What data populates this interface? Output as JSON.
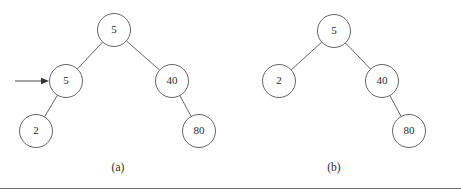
{
  "figure": {
    "background_color": "#ffffff",
    "stroke_color": "#555555",
    "text_color": "#2b2b2b",
    "rule_color": "#6d6d6d",
    "panels": [
      {
        "caption": "(a)",
        "caption_x": 118,
        "caption_y": 168,
        "pointer": {
          "label": "insertion-pointer",
          "x1": 15,
          "y1": 81,
          "x2": 49,
          "y2": 81,
          "target_node": "5-left"
        },
        "nodes": [
          {
            "id": "root",
            "value": "5",
            "cx": 114,
            "cy": 30,
            "r": 16.5
          },
          {
            "id": "5-left",
            "value": "5",
            "cx": 66,
            "cy": 81,
            "r": 16.5
          },
          {
            "id": "40",
            "value": "40",
            "cx": 172,
            "cy": 81,
            "r": 16.5
          },
          {
            "id": "2",
            "value": "2",
            "cx": 36,
            "cy": 131,
            "r": 16.5
          },
          {
            "id": "80",
            "value": "80",
            "cx": 199,
            "cy": 131,
            "r": 16.5
          }
        ],
        "edges": [
          {
            "from": "root",
            "to": "5-left"
          },
          {
            "from": "root",
            "to": "40"
          },
          {
            "from": "5-left",
            "to": "2"
          },
          {
            "from": "40",
            "to": "80"
          }
        ]
      },
      {
        "caption": "(b)",
        "caption_x": 334,
        "caption_y": 168,
        "pointer": null,
        "nodes": [
          {
            "id": "root",
            "value": "5",
            "cx": 334,
            "cy": 31,
            "r": 16.5
          },
          {
            "id": "2",
            "value": "2",
            "cx": 279,
            "cy": 81,
            "r": 16.5
          },
          {
            "id": "40",
            "value": "40",
            "cx": 382,
            "cy": 81,
            "r": 16.5
          },
          {
            "id": "80",
            "value": "80",
            "cx": 409,
            "cy": 131,
            "r": 16.5
          }
        ],
        "edges": [
          {
            "from": "root",
            "to": "2"
          },
          {
            "from": "root",
            "to": "40"
          },
          {
            "from": "40",
            "to": "80"
          }
        ]
      }
    ],
    "rule": {
      "x1": 0,
      "y1": 188.5,
      "x2": 461,
      "y2": 188.5
    }
  }
}
